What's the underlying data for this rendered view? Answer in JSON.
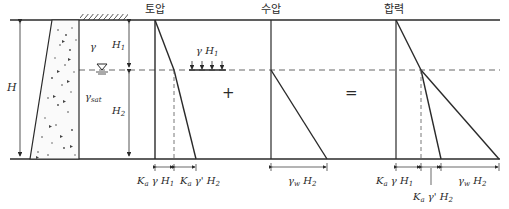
{
  "titles": {
    "soil": "토압",
    "water": "수압",
    "resultant": "합력"
  },
  "operators": {
    "plus": "+",
    "equals": "="
  },
  "labels": {
    "H": "H",
    "H1": "H",
    "H1_sub": "1",
    "H2": "H",
    "H2_sub": "2",
    "gamma": "γ",
    "gamma_sat": "γ",
    "gamma_sat_sub": "sat",
    "surcharge": "γ H",
    "surcharge_sub": "1",
    "soil_top": "K",
    "soil_top_a": "a",
    "soil_top_rest": " γ H",
    "soil_top_sub": "1",
    "soil_bot": "K",
    "soil_bot_a": "a",
    "soil_bot_rest": " γ' H",
    "soil_bot_sub": "2",
    "water": "γ",
    "water_w": "w",
    "water_rest": " H",
    "water_sub": "2",
    "res_top": "K",
    "res_top_a": "a",
    "res_top_rest": " γ H",
    "res_top_sub": "1",
    "res_mid": "K",
    "res_mid_a": "a",
    "res_mid_rest": " γ' H",
    "res_mid_sub": "2",
    "res_water": "γ",
    "res_water_w": "w",
    "res_water_rest": " H",
    "res_water_sub": "2"
  },
  "colors": {
    "line": "#2a2a2a",
    "dash": "#555555"
  }
}
